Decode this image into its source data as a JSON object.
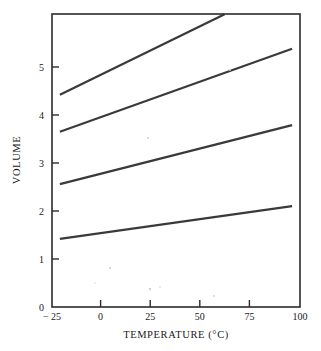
{
  "chart_data": {
    "type": "line",
    "title": "",
    "xlabel": "TEMPERATURE (°C)",
    "ylabel": "VOLUME",
    "xlim": [
      -25,
      100
    ],
    "ylim": [
      0,
      6.1
    ],
    "grid": false,
    "legend": "none",
    "xticks": [
      -25,
      0,
      25,
      50,
      75,
      100
    ],
    "xticklabels": [
      "− 25",
      "0",
      "25",
      "50",
      "75",
      "100"
    ],
    "yticks": [
      0,
      1,
      2,
      3,
      4,
      5
    ],
    "yticklabels": [
      "0",
      "1",
      "2",
      "3",
      "4",
      "5"
    ],
    "series": [
      {
        "name": "line-1",
        "x": [
          -21,
          62
        ],
        "values": [
          4.42,
          6.1
        ],
        "note": "steepest isobar, exits top of frame"
      },
      {
        "name": "line-2",
        "x": [
          -21,
          96
        ],
        "values": [
          3.65,
          5.38
        ],
        "note": ""
      },
      {
        "name": "line-3",
        "x": [
          -21,
          96
        ],
        "values": [
          2.56,
          3.79
        ],
        "note": ""
      },
      {
        "name": "line-4",
        "x": [
          -21,
          96
        ],
        "values": [
          1.42,
          2.1
        ],
        "note": "shallowest isobar"
      }
    ]
  },
  "axes": {
    "x_title": "TEMPERATURE (°C)",
    "y_title": "VOLUME"
  },
  "colors": {
    "line": "#3a3a3a",
    "frame": "#2b2b2b",
    "text": "#1a1a1a",
    "background": "#ffffff"
  }
}
